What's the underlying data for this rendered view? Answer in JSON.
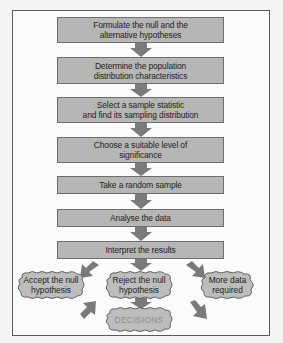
{
  "diagram": {
    "type": "flowchart",
    "steps": [
      {
        "line1": "Formulate the null and the",
        "line2": "alternative hypotheses"
      },
      {
        "line1": "Determine the population",
        "line2": "distribution characteristics"
      },
      {
        "line1": "Select a sample statistic",
        "line2": "and find its sampling distribution"
      },
      {
        "line1": "Choose a suitable level of",
        "line2": "significance"
      },
      {
        "line1": "Take a random sample",
        "line2": ""
      },
      {
        "line1": "Analyse the data",
        "line2": ""
      },
      {
        "line1": "Interpret the results",
        "line2": ""
      }
    ],
    "outcomes": [
      {
        "line1": "Accept the null",
        "line2": "hypothesis"
      },
      {
        "line1": "Reject the null",
        "line2": "hypothesis"
      },
      {
        "line1": "More data",
        "line2": "required"
      }
    ],
    "final": {
      "label": "DECISIONS"
    },
    "colors": {
      "box_fill": "#b6b6b4",
      "box_border": "#6e6e6e",
      "arrow": "#7a7a7a",
      "cloud_fill": "#bdbdbb",
      "final_text": "#8d8d8d"
    }
  }
}
